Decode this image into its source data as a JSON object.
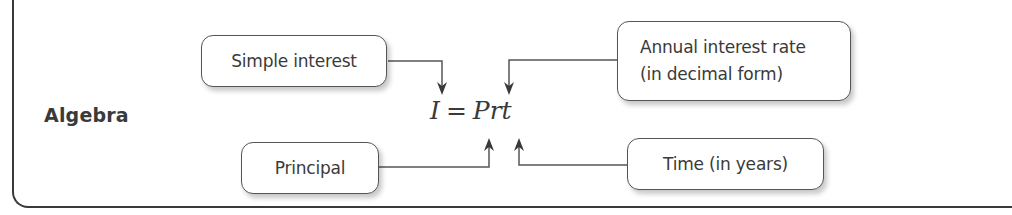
{
  "section": {
    "label": "Algebra"
  },
  "formula": {
    "lhs": "I",
    "equals": "=",
    "rhs": "Prt",
    "full": "I = Prt"
  },
  "callouts": {
    "simple_interest": {
      "label": "Simple interest",
      "points_to": "I"
    },
    "annual_rate": {
      "line1": "Annual interest rate",
      "line2": "(in decimal form)",
      "points_to": "r"
    },
    "principal": {
      "label": "Principal",
      "points_to": "P"
    },
    "time": {
      "label": "Time (in years)",
      "points_to": "t"
    }
  },
  "colors": {
    "text": "#3a3a3a",
    "border": "#555555",
    "background": "#ffffff"
  }
}
